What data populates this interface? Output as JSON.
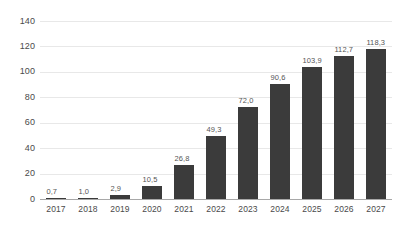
{
  "chart_data": {
    "type": "bar",
    "title": "",
    "subtitle": "",
    "xlabel": "",
    "ylabel": "",
    "categories": [
      "2017",
      "2018",
      "2019",
      "2020",
      "2021",
      "2022",
      "2023",
      "2024",
      "2025",
      "2026",
      "2027"
    ],
    "values": [
      0.7,
      1.0,
      2.9,
      10.5,
      26.8,
      49.3,
      72.0,
      90.6,
      103.9,
      112.7,
      118.3
    ],
    "value_labels": [
      "0,7",
      "1,0",
      "2,9",
      "10,5",
      "26,8",
      "49,3",
      "72,0",
      "90,6",
      "103,9",
      "112,7",
      "118,3"
    ],
    "ylim": [
      0,
      140
    ],
    "yticks": [
      0,
      20,
      40,
      60,
      80,
      100,
      120,
      140
    ],
    "ytick_labels": [
      "0",
      "20",
      "40",
      "60",
      "80",
      "100",
      "120",
      "140"
    ],
    "grid": true,
    "legend": false,
    "legend_position": "none",
    "decimal_separator": ",",
    "colors": {
      "bar": "#3b3b3b",
      "gridline": "#e8e8e8",
      "axis": "#a8a8a8",
      "tick_text": "#4a4a4a",
      "value_text": "#555555",
      "background": "#ffffff"
    }
  }
}
